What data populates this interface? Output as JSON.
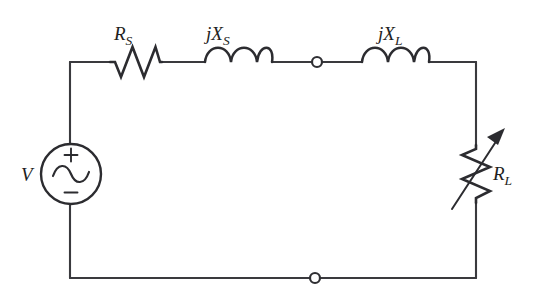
{
  "diagram": {
    "type": "electrical-schematic",
    "background_color": "#ffffff",
    "line_color": "#3a3a3e",
    "component_color": "#2c2c30",
    "text_color": "#1e1e22"
  },
  "labels": {
    "source": {
      "base": "V",
      "sub": ""
    },
    "series_resistor": {
      "base": "R",
      "sub": "S"
    },
    "series_reactance": {
      "base": "jX",
      "sub": "S"
    },
    "load_reactance": {
      "base": "jX",
      "sub": "L"
    },
    "load_resistor": {
      "base": "R",
      "sub": "L"
    },
    "polarity_plus": "+",
    "polarity_minus": "−"
  },
  "components": [
    {
      "name": "voltage-source",
      "kind": "ac-source",
      "label": "V",
      "polarity_top": "+",
      "polarity_bottom": "−",
      "center_x": 71,
      "center_y": 174,
      "radius": 30
    },
    {
      "name": "resistor-rs",
      "kind": "resistor",
      "label": "R_S",
      "orientation": "horizontal",
      "zigzag_peaks": 3,
      "x_start": 110,
      "x_end": 162,
      "y": 62
    },
    {
      "name": "inductor-jxs",
      "kind": "inductor",
      "label": "jX_S",
      "orientation": "horizontal",
      "coil_bumps": 3,
      "x_start": 205,
      "x_end": 272,
      "y": 62
    },
    {
      "name": "terminal-node-top",
      "kind": "node",
      "x": 317,
      "y": 62,
      "radius": 5
    },
    {
      "name": "inductor-jxl",
      "kind": "inductor",
      "label": "jX_L",
      "orientation": "horizontal",
      "coil_bumps": 3,
      "x_start": 362,
      "x_end": 429,
      "y": 62
    },
    {
      "name": "variable-resistor-rl",
      "kind": "variable-resistor",
      "label": "R_L",
      "orientation": "vertical",
      "zigzag_peaks": 3,
      "x": 476,
      "y_start": 145,
      "y_end": 203,
      "arrow": {
        "x1": 452,
        "y1": 208,
        "x2": 504,
        "y2": 131
      }
    },
    {
      "name": "terminal-node-bottom",
      "kind": "node",
      "x": 315,
      "y": 278,
      "radius": 5
    }
  ],
  "wires": [
    {
      "name": "wire-top-left",
      "from": [
        70,
        62
      ],
      "to": [
        110,
        62
      ]
    },
    {
      "name": "wire-rs-to-jxs",
      "from": [
        162,
        62
      ],
      "to": [
        205,
        62
      ]
    },
    {
      "name": "wire-jxs-to-node",
      "from": [
        272,
        62
      ],
      "to": [
        312,
        62
      ]
    },
    {
      "name": "wire-node-to-jxl",
      "from": [
        322,
        62
      ],
      "to": [
        362,
        62
      ]
    },
    {
      "name": "wire-jxl-to-corner",
      "from": [
        429,
        62
      ],
      "to": [
        476,
        62
      ]
    },
    {
      "name": "wire-right-upper",
      "from": [
        476,
        62
      ],
      "to": [
        476,
        145
      ]
    },
    {
      "name": "wire-right-lower",
      "from": [
        476,
        203
      ],
      "to": [
        476,
        278
      ]
    },
    {
      "name": "wire-bottom-right",
      "from": [
        476,
        278
      ],
      "to": [
        320,
        278
      ]
    },
    {
      "name": "wire-bottom-left",
      "from": [
        310,
        278
      ],
      "to": [
        70,
        278
      ]
    },
    {
      "name": "wire-left-lower",
      "from": [
        70,
        278
      ],
      "to": [
        70,
        204
      ]
    },
    {
      "name": "wire-left-upper",
      "from": [
        70,
        144
      ],
      "to": [
        70,
        62
      ]
    }
  ]
}
